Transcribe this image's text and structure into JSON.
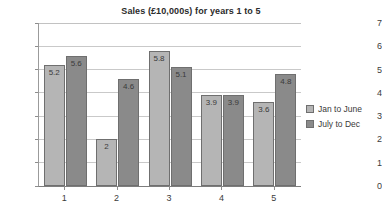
{
  "chart_data": {
    "type": "bar",
    "title": "Sales (£10,000s) for years 1 to 5",
    "xlabel": "",
    "ylabel": "",
    "categories": [
      "1",
      "2",
      "3",
      "4",
      "5"
    ],
    "series": [
      {
        "name": "Jan to June",
        "color": "#b5b5b5",
        "values": [
          5.2,
          2,
          5.8,
          3.9,
          3.6
        ],
        "labels": [
          "5.2",
          "2",
          "5.8",
          "3.9",
          "3.6"
        ]
      },
      {
        "name": "July to Dec",
        "color": "#8a8a8a",
        "values": [
          5.6,
          4.6,
          5.1,
          3.9,
          4.8
        ],
        "labels": [
          "5.6",
          "4.6",
          "5.1",
          "3.9",
          "4.8"
        ]
      }
    ],
    "ylim": [
      0,
      7
    ],
    "yticks": [
      "0",
      "1",
      "2",
      "3",
      "4",
      "5",
      "6",
      "7"
    ],
    "grid": true,
    "legend_position": "right",
    "data_labels": true
  },
  "legend": {
    "entries": [
      {
        "label": "Jan to June"
      },
      {
        "label": "July to Dec"
      }
    ]
  }
}
